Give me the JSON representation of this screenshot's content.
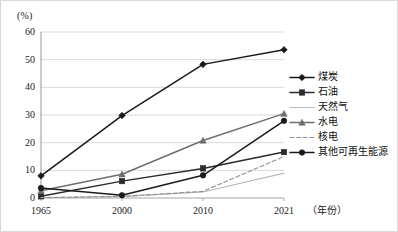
{
  "axis": {
    "unit_label": "(%)",
    "x_title": "（年份）",
    "y_ticks": [
      "60",
      "50",
      "40",
      "30",
      "20",
      "10",
      "0"
    ],
    "x_ticks": [
      "1965",
      "2000",
      "2010",
      "2021"
    ]
  },
  "legend": {
    "items": [
      {
        "label": "煤炭",
        "marker": "diamond",
        "color": "#1a1a1a",
        "dash": "solid"
      },
      {
        "label": "石油",
        "marker": "square",
        "color": "#2b2b2b",
        "dash": "solid"
      },
      {
        "label": "天然气",
        "marker": "none",
        "color": "#b9b9b9",
        "dash": "solid"
      },
      {
        "label": "水电",
        "marker": "triangle",
        "color": "#6e6e6e",
        "dash": "solid"
      },
      {
        "label": "核电",
        "marker": "none",
        "color": "#8f8f8f",
        "dash": "dashed"
      },
      {
        "label": "其他可再生能源",
        "marker": "circle",
        "color": "#1a1a1a",
        "dash": "solid"
      }
    ]
  },
  "chart_data": {
    "type": "line",
    "title": "",
    "xlabel": "（年份）",
    "ylabel": "(%)",
    "categories": [
      "1965",
      "2000",
      "2010",
      "2021"
    ],
    "x": [
      1965,
      2000,
      2010,
      2021
    ],
    "ylim": [
      0,
      60
    ],
    "xlim": [
      1965,
      2021
    ],
    "ytick_step": 10,
    "grid": "horizontal",
    "legend_position": "right",
    "series": [
      {
        "name": "煤炭",
        "values": [
          8.0,
          29.8,
          48.3,
          53.6
        ],
        "marker": "diamond",
        "color": "#1a1a1a",
        "dash": "solid"
      },
      {
        "name": "石油",
        "values": [
          0.6,
          6.1,
          10.7,
          16.6
        ],
        "marker": "square",
        "color": "#2b2b2b",
        "dash": "solid"
      },
      {
        "name": "天然气",
        "values": [
          0.2,
          0.5,
          2.2,
          9.0
        ],
        "marker": "none",
        "color": "#b9b9b9",
        "dash": "solid"
      },
      {
        "name": "水电",
        "values": [
          2.6,
          8.6,
          20.8,
          30.5
        ],
        "marker": "triangle",
        "color": "#6e6e6e",
        "dash": "solid"
      },
      {
        "name": "核电",
        "values": [
          0.1,
          0.6,
          2.4,
          15.0
        ],
        "marker": "none",
        "color": "#8f8f8f",
        "dash": "dashed"
      },
      {
        "name": "其他可再生能源",
        "values": [
          3.6,
          1.0,
          8.2,
          27.9
        ],
        "marker": "circle",
        "color": "#1a1a1a",
        "dash": "solid"
      }
    ]
  }
}
